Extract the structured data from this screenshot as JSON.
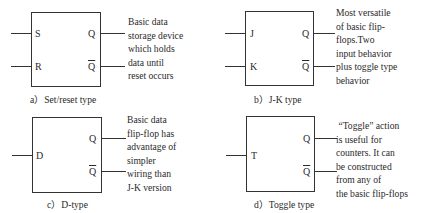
{
  "figures": [
    {
      "id": "a",
      "inputs": [
        "S",
        "R"
      ],
      "outputs": [
        "Q",
        "Q"
      ],
      "description": "Basic data\nstorage device\nwhich holds\ndata until\nreset occurs",
      "caption": "a）Set/reset type"
    },
    {
      "id": "b",
      "inputs": [
        "J",
        "K"
      ],
      "outputs": [
        "Q",
        "Q"
      ],
      "description": "Most versatile\nof basic flip-\nflops.Two\ninput behavior\nplus toggle type\nbehavior",
      "caption": "b）J-K type"
    },
    {
      "id": "c",
      "inputs": [
        "D"
      ],
      "outputs": [
        "Q",
        "Q"
      ],
      "description": "Basic data\nflip-flop has\nadvantage of\nsimpler\nwiring than\nJ-K version",
      "caption": "c）D-type"
    },
    {
      "id": "d",
      "inputs": [
        "T"
      ],
      "outputs": [
        "Q",
        "Q"
      ],
      "description": " “Toggle” action\nis useful for\ncounters. It can\nbe constructed\nfrom any of\nthe basic flip-flops",
      "caption": "d）Toggle type"
    }
  ],
  "colors": {
    "line": "#333333",
    "text": "#2a2a2a",
    "background": "#ffffff"
  }
}
